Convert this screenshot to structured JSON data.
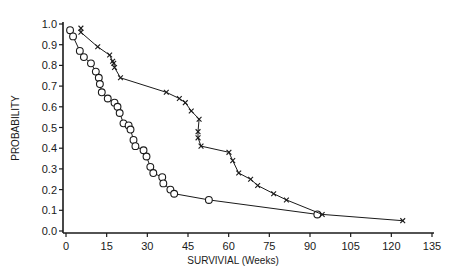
{
  "chart_data": {
    "type": "line",
    "title": "",
    "xlabel": "SURVIVIAL (Weeks)",
    "ylabel": "PROBABILITY",
    "xlim": [
      0,
      135
    ],
    "ylim": [
      0.0,
      1.0
    ],
    "grid": false,
    "x_ticks": [
      "0",
      "15",
      "30",
      "45",
      "60",
      "75",
      "90",
      "105",
      "120",
      "135"
    ],
    "x_tick_values": [
      0,
      15,
      30,
      45,
      60,
      75,
      90,
      105,
      120,
      135
    ],
    "y_ticks": [
      "0.0",
      "0.1",
      "0.2",
      "0.3",
      "0.4",
      "0.5",
      "0.6",
      "0.7",
      "0.8",
      "0.9",
      "1.0"
    ],
    "y_tick_values": [
      0.0,
      0.1,
      0.2,
      0.3,
      0.4,
      0.5,
      0.6,
      0.7,
      0.8,
      0.9,
      1.0
    ],
    "series": [
      {
        "name": "circle-group",
        "marker": "circle",
        "points": [
          [
            1.5,
            0.97
          ],
          [
            2.6,
            0.94
          ],
          [
            5.1,
            0.87
          ],
          [
            6.6,
            0.84
          ],
          [
            9.2,
            0.81
          ],
          [
            11.0,
            0.77
          ],
          [
            12.1,
            0.74
          ],
          [
            12.5,
            0.71
          ],
          [
            13.2,
            0.67
          ],
          [
            15.4,
            0.64
          ],
          [
            17.9,
            0.62
          ],
          [
            19.0,
            0.6
          ],
          [
            19.8,
            0.57
          ],
          [
            21.2,
            0.52
          ],
          [
            23.1,
            0.51
          ],
          [
            23.8,
            0.49
          ],
          [
            24.9,
            0.44
          ],
          [
            25.6,
            0.41
          ],
          [
            28.6,
            0.39
          ],
          [
            29.7,
            0.36
          ],
          [
            31.1,
            0.31
          ],
          [
            32.2,
            0.28
          ],
          [
            35.5,
            0.26
          ],
          [
            35.9,
            0.23
          ],
          [
            38.5,
            0.2
          ],
          [
            39.9,
            0.18
          ],
          [
            52.7,
            0.15
          ],
          [
            92.7,
            0.08
          ]
        ]
      },
      {
        "name": "cross-group",
        "marker": "x",
        "points": [
          [
            5.5,
            0.98
          ],
          [
            5.5,
            0.96
          ],
          [
            11.7,
            0.89
          ],
          [
            16.1,
            0.85
          ],
          [
            17.2,
            0.82
          ],
          [
            17.6,
            0.81
          ],
          [
            17.9,
            0.79
          ],
          [
            20.1,
            0.74
          ],
          [
            37.0,
            0.67
          ],
          [
            41.8,
            0.64
          ],
          [
            44.0,
            0.62
          ],
          [
            46.2,
            0.58
          ],
          [
            49.1,
            0.54
          ],
          [
            48.7,
            0.48
          ],
          [
            48.7,
            0.45
          ],
          [
            49.8,
            0.41
          ],
          [
            60.1,
            0.38
          ],
          [
            61.5,
            0.34
          ],
          [
            63.7,
            0.28
          ],
          [
            68.1,
            0.25
          ],
          [
            70.7,
            0.22
          ],
          [
            76.6,
            0.18
          ],
          [
            81.3,
            0.15
          ],
          [
            94.5,
            0.08
          ],
          [
            124.2,
            0.05
          ]
        ]
      }
    ]
  }
}
